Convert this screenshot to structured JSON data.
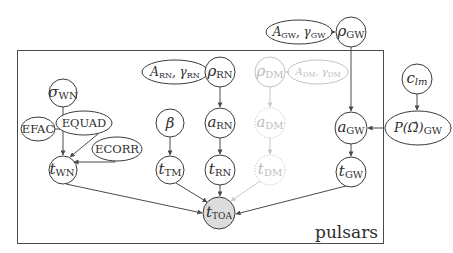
{
  "plate": {
    "label": "pulsars"
  },
  "nodes": {
    "sigma_wn": {
      "sym": "σ",
      "sub": "WN"
    },
    "efac": {
      "label": "EFAC"
    },
    "equad": {
      "label": "EQUAD"
    },
    "ecorr": {
      "label": "ECORR"
    },
    "t_wn": {
      "sym": "t",
      "sub": "WN"
    },
    "a_rn_gamma_rn": {
      "sym1": "A",
      "sub1": "RN",
      "sep": ", ",
      "sym2": "γ",
      "sub2": "RN"
    },
    "rho_rn": {
      "sym": "ρ",
      "sub": "RN"
    },
    "beta": {
      "sym": "β"
    },
    "a_rn": {
      "sym": "a",
      "sub": "RN"
    },
    "t_tm": {
      "sym": "t",
      "sub": "TM"
    },
    "t_rn": {
      "sym": "t",
      "sub": "RN"
    },
    "rho_dm": {
      "sym": "ρ",
      "sub": "DM"
    },
    "a_dm_gamma_dm": {
      "sym1": "A",
      "sub1": "DM",
      "sep": ", ",
      "sym2": "γ",
      "sub2": "DM"
    },
    "a_dm": {
      "sym": "a",
      "sub": "DM"
    },
    "t_dm": {
      "sym": "t",
      "sub": "DM"
    },
    "a_gw_gamma_gw": {
      "sym1": "A",
      "sub1": "GW",
      "sep": ", ",
      "sym2": "γ",
      "sub2": "GW"
    },
    "rho_gw": {
      "sym": "ρ",
      "sub": "GW"
    },
    "c_lm": {
      "sym": "c",
      "sub": "lm"
    },
    "p_omega_gw": {
      "sym": "P(Ω̂)",
      "sub": "GW"
    },
    "a_gw": {
      "sym": "a",
      "sub": "GW"
    },
    "t_gw": {
      "sym": "t",
      "sub": "GW"
    },
    "t_toa": {
      "sym": "t",
      "sub": "TOA"
    }
  },
  "edges": [
    {
      "from": "sigma_wn",
      "to": "t_wn"
    },
    {
      "from": "efac",
      "to": "t_wn"
    },
    {
      "from": "equad",
      "to": "t_wn"
    },
    {
      "from": "ecorr",
      "to": "t_wn"
    },
    {
      "from": "a_rn_gamma_rn",
      "to": "rho_rn"
    },
    {
      "from": "rho_rn",
      "to": "a_rn"
    },
    {
      "from": "a_rn",
      "to": "t_rn"
    },
    {
      "from": "beta",
      "to": "t_tm"
    },
    {
      "from": "a_dm_gamma_dm",
      "to": "rho_dm",
      "style": "faint"
    },
    {
      "from": "rho_dm",
      "to": "a_dm",
      "style": "faint"
    },
    {
      "from": "a_dm",
      "to": "t_dm",
      "style": "faint"
    },
    {
      "from": "t_dm",
      "to": "t_toa",
      "style": "faint"
    },
    {
      "from": "a_gw_gamma_gw",
      "to": "rho_gw"
    },
    {
      "from": "rho_gw",
      "to": "a_gw"
    },
    {
      "from": "c_lm",
      "to": "p_omega_gw"
    },
    {
      "from": "p_omega_gw",
      "to": "a_gw"
    },
    {
      "from": "a_gw",
      "to": "t_gw"
    },
    {
      "from": "t_wn",
      "to": "t_toa"
    },
    {
      "from": "t_tm",
      "to": "t_toa"
    },
    {
      "from": "t_rn",
      "to": "t_toa"
    },
    {
      "from": "t_gw",
      "to": "t_toa"
    }
  ],
  "colors": {
    "stroke": "#3a3a3a",
    "faint": "#c2c2c2",
    "observed_fill": "#dcdcdc"
  }
}
